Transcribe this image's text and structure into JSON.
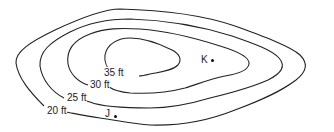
{
  "diagram": {
    "type": "topographic contour map",
    "contours": [
      {
        "label": "20 ft",
        "elevation": 20
      },
      {
        "label": "25 ft",
        "elevation": 25
      },
      {
        "label": "30 ft",
        "elevation": 30
      },
      {
        "label": "35 ft",
        "elevation": 35
      }
    ],
    "points": [
      {
        "label": "K"
      },
      {
        "label": "J"
      }
    ],
    "colors": {
      "line": "#222222",
      "background": "#ffffff"
    }
  }
}
